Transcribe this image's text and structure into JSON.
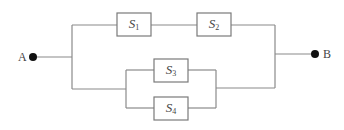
{
  "diagram": {
    "type": "reliability-block-diagram",
    "terminals": [
      {
        "id": "A",
        "label": "A"
      },
      {
        "id": "B",
        "label": "B"
      }
    ],
    "components": [
      {
        "id": "S1",
        "name": "S",
        "sub": "1"
      },
      {
        "id": "S2",
        "name": "S",
        "sub": "2"
      },
      {
        "id": "S3",
        "name": "S",
        "sub": "3"
      },
      {
        "id": "S4",
        "name": "S",
        "sub": "4"
      }
    ],
    "structure": "A — [ (S1 series S2) parallel (S3 parallel S4) ] — B",
    "colors": {
      "line": "#8a8a8a",
      "box": "#7a7a7a",
      "dot": "#111111",
      "text": "#444444"
    }
  }
}
